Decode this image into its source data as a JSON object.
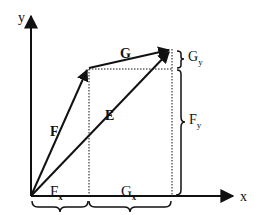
{
  "diagram": {
    "type": "vector-addition",
    "axes": {
      "x_label": "x",
      "y_label": "y"
    },
    "vectors": [
      {
        "name": "F",
        "label": "F"
      },
      {
        "name": "G",
        "label": "G"
      },
      {
        "name": "E",
        "label": "E"
      }
    ],
    "components": {
      "Fx": {
        "main": "F",
        "sub": "x"
      },
      "Gx": {
        "main": "G",
        "sub": "x"
      },
      "Fy": {
        "main": "F",
        "sub": "y"
      },
      "Gy": {
        "main": "G",
        "sub": "y"
      }
    },
    "colors": {
      "stroke": "#111111",
      "background": "#ffffff"
    }
  }
}
